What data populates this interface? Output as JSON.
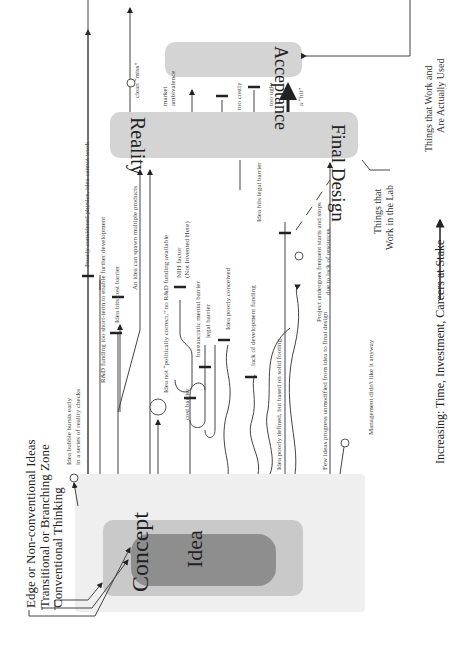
{
  "legend": {
    "edge": "Edge or Non-conventional Ideas",
    "transitional": "Transitional or Branching Zone",
    "conventional": "Conventional Thinking"
  },
  "stages": {
    "idea": "Idea",
    "concept": "Concept",
    "reality": "Reality",
    "final_design": "Final Design",
    "acceptance": "Acceptance"
  },
  "annotations": {
    "bubble_bursts_1": "Idea bubble bursts early",
    "bubble_bursts_2": "in a series of reality checks",
    "rd_funding": "R&D funding too short-term to enable further development",
    "poor_physics": "Poorly considered physics, idea cannot work",
    "cost_barrier_idea": "Idea hits cost barrier",
    "spawn": "An idea can spawn multiple products",
    "politically": "Idea not “politically correct,” no R&D funding available",
    "nih_1": "NIH factor",
    "nih_2": "(Not Invented Here)",
    "cost_barrier": "cost barrier",
    "bureaucratic": "bureaucratic mental barrier",
    "legal_barrier": "legal barrier",
    "poorly_conceived": "Idea poorly conceived",
    "lack_funding": "lack of development funding",
    "poorly_defined": "Idea poorly defined, but based on solid footing",
    "legal_hits": "Idea hits legal barrier",
    "starts_stops_1": "Project undergoes frequent starts and stops",
    "starts_stops_2": "due to lack of resources",
    "few_ideas": "Few ideas progress unmodified from idea to final design",
    "management": "Management didn't like it anyway",
    "clean_miss": "clean “miss”",
    "market_1": "market",
    "market_2": "ambivalence",
    "too_costly": "too costly",
    "too_ugly": "too ugly",
    "hit": "a “hit”",
    "lab_1": "Things that",
    "lab_2": "Work in the Lab",
    "used_1": "Things that Work and",
    "used_2": "Are Actually Used"
  },
  "axis": {
    "label": "Increasing:  Time, Investment, Careers at Stake"
  },
  "colors": {
    "outer_zone": "#efefef",
    "middle_zone": "#c8c8c8",
    "inner_zone": "#8e8e8e",
    "stage_box": "#d4d4d4",
    "line": "#333333"
  }
}
